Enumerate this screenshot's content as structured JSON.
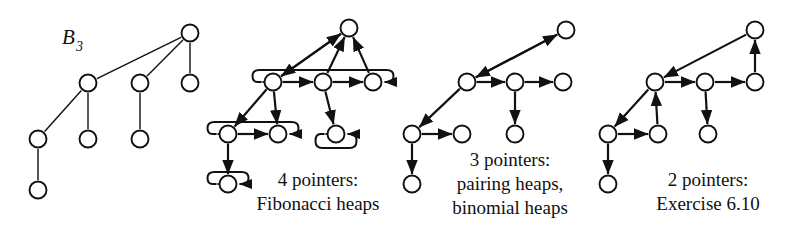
{
  "figure": {
    "title_label": "B",
    "title_sub": "3",
    "background": "#ffffff",
    "stroke": "#111111",
    "node_fill": "#ffffff",
    "node_radius": 8.5
  },
  "panels": [
    {
      "id": "binomial-tree",
      "caption_lines": [],
      "nodes": [
        {
          "id": "t1-root",
          "x": 190,
          "y": 33
        },
        {
          "id": "t1-c1",
          "x": 88,
          "y": 83
        },
        {
          "id": "t1-c2",
          "x": 140,
          "y": 83
        },
        {
          "id": "t1-c3",
          "x": 190,
          "y": 83
        },
        {
          "id": "t1-g1",
          "x": 38,
          "y": 139
        },
        {
          "id": "t1-g2",
          "x": 88,
          "y": 139
        },
        {
          "id": "t1-g3",
          "x": 140,
          "y": 139
        },
        {
          "id": "t1-gg1",
          "x": 38,
          "y": 190
        }
      ],
      "edges": [
        {
          "from": "t1-root",
          "to": "t1-c1",
          "arrow": "none"
        },
        {
          "from": "t1-root",
          "to": "t1-c2",
          "arrow": "none"
        },
        {
          "from": "t1-root",
          "to": "t1-c3",
          "arrow": "none"
        },
        {
          "from": "t1-c1",
          "to": "t1-g1",
          "arrow": "none"
        },
        {
          "from": "t1-c1",
          "to": "t1-g2",
          "arrow": "none"
        },
        {
          "from": "t1-c2",
          "to": "t1-g3",
          "arrow": "none"
        },
        {
          "from": "t1-g1",
          "to": "t1-gg1",
          "arrow": "none"
        }
      ]
    },
    {
      "id": "four-pointers",
      "caption_lines": [
        "4 pointers:",
        "Fibonacci heaps"
      ],
      "caption_x": 318,
      "caption_y": 186,
      "nodes": [
        {
          "id": "t2-root",
          "x": 349,
          "y": 28
        },
        {
          "id": "t2-c1",
          "x": 273,
          "y": 82
        },
        {
          "id": "t2-c2",
          "x": 323,
          "y": 82
        },
        {
          "id": "t2-c3",
          "x": 373,
          "y": 82
        },
        {
          "id": "t2-g1",
          "x": 228,
          "y": 134
        },
        {
          "id": "t2-g2",
          "x": 278,
          "y": 134
        },
        {
          "id": "t2-g3",
          "x": 336,
          "y": 134
        },
        {
          "id": "t2-gg1",
          "x": 228,
          "y": 184
        }
      ],
      "edges": [
        {
          "from": "t2-c1",
          "to": "t2-root",
          "arrow": "end"
        },
        {
          "from": "t2-c2",
          "to": "t2-root",
          "arrow": "end"
        },
        {
          "from": "t2-c3",
          "to": "t2-root",
          "arrow": "end"
        },
        {
          "from": "t2-root",
          "to": "t2-c1",
          "arrow": "end"
        },
        {
          "from": "t2-c1",
          "to": "t2-c2",
          "arrow": "both"
        },
        {
          "from": "t2-c2",
          "to": "t2-c3",
          "arrow": "both"
        },
        {
          "from": "t2-c1",
          "to": "t2-g1",
          "arrow": "both"
        },
        {
          "from": "t2-c1",
          "to": "t2-g2",
          "arrow": "both"
        },
        {
          "from": "t2-c2",
          "to": "t2-g3",
          "arrow": "both"
        },
        {
          "from": "t2-g1",
          "to": "t2-g2",
          "arrow": "both"
        },
        {
          "from": "t2-g1",
          "to": "t2-gg1",
          "arrow": "both"
        }
      ],
      "wrap_lists": [
        {
          "left": "t2-c1",
          "right": "t2-c3",
          "y": 70,
          "side": "top"
        },
        {
          "left": "t2-g1",
          "right": "t2-g2",
          "y": 122,
          "side": "top"
        },
        {
          "left": "t2-g3",
          "right": "t2-g3",
          "y": 148,
          "side": "bottom"
        },
        {
          "left": "t2-gg1",
          "right": "t2-gg1",
          "y": 172,
          "side": "top"
        }
      ]
    },
    {
      "id": "three-pointers",
      "caption_lines": [
        "3 pointers:",
        "pairing heaps,",
        "binomial heaps"
      ],
      "caption_x": 510,
      "caption_y": 166,
      "nodes": [
        {
          "id": "t3-root",
          "x": 566,
          "y": 30
        },
        {
          "id": "t3-c1",
          "x": 467,
          "y": 82
        },
        {
          "id": "t3-c2",
          "x": 515,
          "y": 82
        },
        {
          "id": "t3-c3",
          "x": 563,
          "y": 82
        },
        {
          "id": "t3-g1",
          "x": 412,
          "y": 134
        },
        {
          "id": "t3-g2",
          "x": 462,
          "y": 134
        },
        {
          "id": "t3-g3",
          "x": 515,
          "y": 134
        },
        {
          "id": "t3-gg1",
          "x": 412,
          "y": 184
        }
      ],
      "edges": [
        {
          "from": "t3-c1",
          "to": "t3-root",
          "arrow": "end"
        },
        {
          "from": "t3-root",
          "to": "t3-c1",
          "arrow": "end"
        },
        {
          "from": "t3-c1",
          "to": "t3-c2",
          "arrow": "both"
        },
        {
          "from": "t3-c2",
          "to": "t3-c3",
          "arrow": "both"
        },
        {
          "from": "t3-c1",
          "to": "t3-g1",
          "arrow": "both"
        },
        {
          "from": "t3-c2",
          "to": "t3-g3",
          "arrow": "both"
        },
        {
          "from": "t3-g1",
          "to": "t3-g2",
          "arrow": "both"
        },
        {
          "from": "t3-g1",
          "to": "t3-gg1",
          "arrow": "both"
        }
      ],
      "wrap_lists": []
    },
    {
      "id": "two-pointers",
      "caption_lines": [
        "2 pointers:",
        "Exercise 6.10"
      ],
      "caption_x": 708,
      "caption_y": 186,
      "nodes": [
        {
          "id": "t4-root",
          "x": 755,
          "y": 30
        },
        {
          "id": "t4-c1",
          "x": 655,
          "y": 82
        },
        {
          "id": "t4-c2",
          "x": 705,
          "y": 82
        },
        {
          "id": "t4-c3",
          "x": 755,
          "y": 82
        },
        {
          "id": "t4-g1",
          "x": 608,
          "y": 134
        },
        {
          "id": "t4-g2",
          "x": 658,
          "y": 134
        },
        {
          "id": "t4-g3",
          "x": 708,
          "y": 134
        },
        {
          "id": "t4-gg1",
          "x": 608,
          "y": 184
        }
      ],
      "edges": [
        {
          "from": "t4-c3",
          "to": "t4-root",
          "arrow": "end"
        },
        {
          "from": "t4-root",
          "to": "t4-c1",
          "arrow": "end"
        },
        {
          "from": "t4-c1",
          "to": "t4-c2",
          "arrow": "end"
        },
        {
          "from": "t4-c2",
          "to": "t4-c3",
          "arrow": "end"
        },
        {
          "from": "t4-c1",
          "to": "t4-g1",
          "arrow": "end"
        },
        {
          "from": "t4-g2",
          "to": "t4-c1",
          "arrow": "end"
        },
        {
          "from": "t4-c2",
          "to": "t4-g3",
          "arrow": "both"
        },
        {
          "from": "t4-g1",
          "to": "t4-g2",
          "arrow": "end"
        },
        {
          "from": "t4-g1",
          "to": "t4-gg1",
          "arrow": "both"
        }
      ],
      "wrap_lists": []
    }
  ]
}
